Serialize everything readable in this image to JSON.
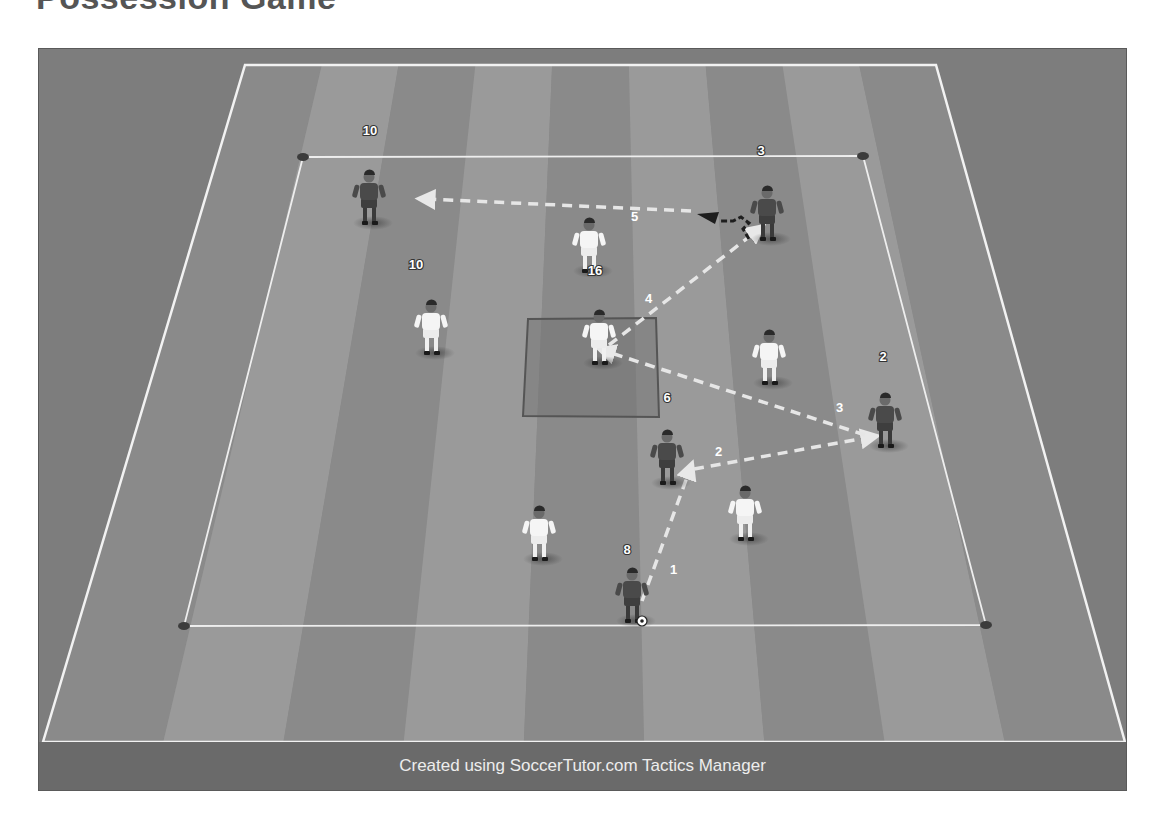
{
  "title": "Possession Game",
  "footer": "Created using SoccerTutor.com Tactics Manager",
  "colors": {
    "frame_bg": "#7d7d7d",
    "stripe_dark": "#8a8a8a",
    "stripe_light": "#9a9a9a",
    "line": "#f2f2f2",
    "team_dark": "#4a4a4a",
    "team_white": "#f5f5f5",
    "arrow": "#e6e6e6"
  },
  "pitch": {
    "outer": {
      "tl": [
        206,
        16
      ],
      "tr": [
        897,
        16
      ],
      "br": [
        1086,
        693
      ],
      "bl": [
        4,
        693
      ]
    },
    "inner": {
      "tl": [
        264,
        108
      ],
      "tr": [
        824,
        107
      ],
      "br": [
        947,
        576
      ],
      "bl": [
        145,
        577
      ]
    },
    "center_square": {
      "tl": [
        489,
        270
      ],
      "tr": [
        617,
        269
      ],
      "br": [
        620,
        368
      ],
      "bl": [
        484,
        367
      ]
    },
    "cones": [
      [
        264,
        108
      ],
      [
        824,
        107
      ],
      [
        947,
        576
      ],
      [
        145,
        577
      ]
    ]
  },
  "players": [
    {
      "team": "dark",
      "number": "10",
      "x": 330,
      "y": 132,
      "label_pos": [
        331,
        86
      ]
    },
    {
      "team": "dark",
      "number": "3",
      "x": 728,
      "y": 148,
      "label_pos": [
        722,
        106
      ]
    },
    {
      "team": "white",
      "number": "16",
      "x": 550,
      "y": 180,
      "label_pos": [
        556,
        226
      ]
    },
    {
      "team": "white",
      "number": "10",
      "x": 392,
      "y": 262,
      "label_pos": [
        377,
        220
      ]
    },
    {
      "team": "white",
      "number": "",
      "x": 560,
      "y": 272
    },
    {
      "team": "white",
      "number": "",
      "x": 730,
      "y": 292
    },
    {
      "team": "dark",
      "number": "2",
      "x": 846,
      "y": 355,
      "label_pos": [
        844,
        312
      ]
    },
    {
      "team": "dark",
      "number": "6",
      "x": 628,
      "y": 392,
      "label_pos": [
        628,
        353
      ]
    },
    {
      "team": "white",
      "number": "",
      "x": 706,
      "y": 448
    },
    {
      "team": "white",
      "number": "",
      "x": 500,
      "y": 468
    },
    {
      "team": "dark",
      "number": "8",
      "x": 593,
      "y": 530,
      "label_pos": [
        588,
        505
      ],
      "has_ball": true
    }
  ],
  "passes": [
    {
      "step": "1",
      "from": [
        603,
        552
      ],
      "to": [
        651,
        420
      ],
      "label_pos": [
        631,
        525
      ]
    },
    {
      "step": "2",
      "from": [
        655,
        420
      ],
      "to": [
        832,
        388
      ],
      "label_pos": [
        676,
        407
      ]
    },
    {
      "step": "3",
      "from": [
        826,
        386
      ],
      "to": [
        566,
        302
      ],
      "label_pos": [
        797,
        363
      ]
    },
    {
      "step": "4",
      "from": [
        570,
        296
      ],
      "to": [
        719,
        181
      ],
      "label_pos": [
        606,
        254
      ]
    },
    {
      "step": "5",
      "from": [
        652,
        162
      ],
      "to": [
        386,
        150
      ],
      "label_pos": [
        592,
        172
      ]
    }
  ],
  "dribble": {
    "from": [
      710,
      190
    ],
    "to": [
      658,
      165
    ]
  }
}
